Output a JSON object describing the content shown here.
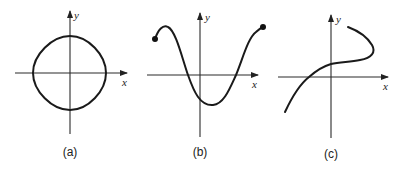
{
  "figure": {
    "panels": [
      {
        "id": "a",
        "caption": "(a)",
        "x_label": "x",
        "y_label": "y",
        "curve_description": "closed rounded-diamond loop centered at origin",
        "curve_path": "M70,36 C88,36 106,55 106,73 C106,91 88,110 70,110 C52,110 33,91 33,73 C33,55 52,36 70,36 Z",
        "endpoints": []
      },
      {
        "id": "b",
        "caption": "(b)",
        "x_label": "x",
        "y_label": "y",
        "curve_description": "wave with closed-dot endpoints, peak left of y-axis, minimum right of y-axis",
        "curve_path": "M155,39 C158,30 163,24 168,27 C176,31 182,58 188,75 C194,92 200,106 213,105 C224,104 230,88 236,75 C243,58 248,38 256,32 C259,29 261,28 263,27",
        "endpoints": [
          [
            155,
            39
          ],
          [
            263,
            27
          ]
        ]
      },
      {
        "id": "c",
        "caption": "(c)",
        "x_label": "x",
        "y_label": "y",
        "curve_description": "increasing curve that folds back upward (not a function)",
        "curve_path": "M285,112 C292,97 300,84 309,77 C317,70 324,66 331,64 C340,62 350,62 360,60 C372,58 376,52 372,45 C366,35 356,30 348,27",
        "endpoints": []
      }
    ]
  }
}
